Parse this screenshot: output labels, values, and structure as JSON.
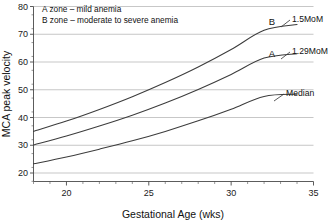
{
  "chart_data": {
    "type": "line",
    "title": "",
    "xlabel": "Gestational Age (wks)",
    "ylabel": "MCA peak velocity",
    "xlim": [
      18,
      35
    ],
    "ylim": [
      17,
      80
    ],
    "xticks": [
      20,
      25,
      30,
      35
    ],
    "yticks": [
      20,
      30,
      40,
      50,
      60,
      70,
      80
    ],
    "x_minor_step": 1,
    "y_minor_step": 5,
    "grid": "horizontal",
    "legend_position": "none",
    "x": [
      18,
      20,
      22,
      24,
      26,
      28,
      30,
      32,
      34
    ],
    "series": [
      {
        "name": "1.5MoM",
        "label": "1.5MoM",
        "zone_letter": "B",
        "values": [
          35.0,
          38.7,
          42.9,
          47.5,
          52.6,
          58.2,
          64.5,
          71.4,
          73.5
        ]
      },
      {
        "name": "1.29MoM",
        "label": "1.29MoM",
        "zone_letter": "A",
        "values": [
          30.1,
          33.3,
          36.9,
          40.8,
          45.2,
          50.1,
          55.5,
          61.4,
          63.0
        ]
      },
      {
        "name": "Median",
        "label": "Median",
        "zone_letter": "",
        "values": [
          23.3,
          25.8,
          28.6,
          31.6,
          35.0,
          38.8,
          43.0,
          47.6,
          48.4
        ]
      }
    ],
    "annotations": [
      "A zone  –  mild anemia",
      "B  zone – moderate to severe anemia"
    ]
  },
  "axes": {
    "y_title": "MCA peak velocity",
    "x_title": "Gestational Age (wks)",
    "y_tick_labels": [
      "20",
      "30",
      "40",
      "50",
      "60",
      "70",
      "80"
    ],
    "x_tick_labels": [
      "20",
      "25",
      "30",
      "35"
    ]
  },
  "legend": {
    "line_a": "A zone  –  mild anemia",
    "line_b": "B  zone – moderate to severe anemia"
  },
  "curve_labels": {
    "b_letter": "B",
    "b_value": "1.5MoM",
    "a_letter": "A",
    "a_value": "1.29MoM",
    "median": "Median"
  },
  "colors": {
    "curve": "#3c3c3c",
    "grid": "#b9b9b9",
    "axis": "#4a4a4a",
    "text": "#111111",
    "background": "#ffffff"
  }
}
